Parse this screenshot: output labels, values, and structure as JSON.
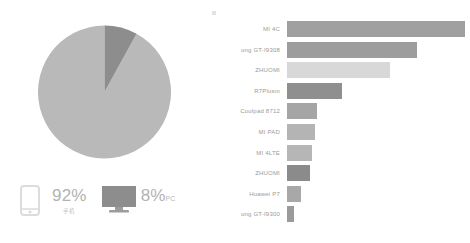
{
  "chart_data": [
    {
      "type": "pie",
      "title": "",
      "labels": [
        "Mobile",
        "PC"
      ],
      "values": [
        92,
        8
      ],
      "unit": "%",
      "colors": [
        "#b9b9b9",
        "#8d8d8d"
      ],
      "legend_position": "bottom",
      "start_angle_deg": 0,
      "direction": "clockwise"
    },
    {
      "type": "bar",
      "orientation": "horizontal",
      "title": "",
      "xlabel": "",
      "ylabel": "",
      "grid": false,
      "legend_position": "none",
      "categories": [
        "MI 4C",
        "ung GT-I9308",
        "ZHUOMI",
        "R7Plusm",
        "Coolpad 8712",
        "MI PAD",
        "MI 4LTE",
        "ZHUOMI",
        "Huawei P7",
        "ung GT-I9300"
      ],
      "values": [
        100,
        73,
        58,
        31,
        17,
        16,
        14,
        13,
        8,
        4
      ],
      "xlim": [
        0,
        100
      ],
      "bar_colors": [
        "#a0a0a0",
        "#9d9d9d",
        "#d8d8d8",
        "#8f8f8f",
        "#a5a5a5",
        "#b4b4b4",
        "#b6b6b6",
        "#8b8b8b",
        "#a8a8a8",
        "#9b9b9b"
      ]
    }
  ],
  "pie_panel": {
    "legend": [
      {
        "icon": "mobile-phone-icon",
        "percent": "92%",
        "unit": "",
        "sublabel": "手机",
        "color": "#b9b9b9"
      },
      {
        "icon": "desktop-monitor-icon",
        "percent": "8%",
        "unit": "PC",
        "sublabel": "",
        "color": "#8d8d8d"
      }
    ]
  },
  "bar_panel": {
    "rows": [
      {
        "label": "MI 4C",
        "value": 100
      },
      {
        "label": "ung GT-I9308",
        "value": 73
      },
      {
        "label": "ZHUOMI",
        "value": 58
      },
      {
        "label": "R7Plusm",
        "value": 31
      },
      {
        "label": "Coolpad 8712",
        "value": 17
      },
      {
        "label": "MI PAD",
        "value": 16
      },
      {
        "label": "MI 4LTE",
        "value": 14
      },
      {
        "label": "ZHUOMI",
        "value": 13
      },
      {
        "label": "Huawei P7",
        "value": 8
      },
      {
        "label": "ung GT-I9300",
        "value": 4
      }
    ]
  },
  "colors": {
    "pie_major": "#b9b9b9",
    "pie_minor": "#8d8d8d",
    "bar_default": "#a0a0a0",
    "text_muted": "#9a9a9a",
    "background": "#ffffff"
  }
}
